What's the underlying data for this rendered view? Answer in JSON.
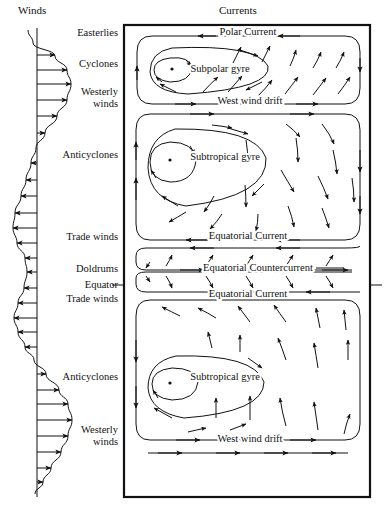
{
  "figure": {
    "width": 384,
    "height": 519,
    "background": "#ffffff",
    "ink_color": "#111111"
  },
  "headers": {
    "winds": "Winds",
    "currents": "Currents"
  },
  "wind_zones": [
    {
      "id": "easterlies",
      "label": "Easterlies",
      "y": 33
    },
    {
      "id": "cyclones",
      "label": "Cyclones",
      "y": 64
    },
    {
      "id": "westerly-winds-n",
      "label": "Westerly\nwinds",
      "y": 92
    },
    {
      "id": "anticyclones-n",
      "label": "Anticyclones",
      "y": 155
    },
    {
      "id": "trade-winds-n",
      "label": "Trade winds",
      "y": 237
    },
    {
      "id": "doldrums",
      "label": "Doldrums",
      "y": 269
    },
    {
      "id": "equator",
      "label": "Equator",
      "y": 285
    },
    {
      "id": "trade-winds-s",
      "label": "Trade winds",
      "y": 299
    },
    {
      "id": "anticyclones-s",
      "label": "Anticyclones",
      "y": 377
    },
    {
      "id": "westerly-winds-s",
      "label": "Westerly\nwinds",
      "y": 430
    }
  ],
  "current_labels": [
    {
      "id": "polar-current",
      "text": "Polar Current",
      "x": 248,
      "y": 35
    },
    {
      "id": "subpolar-gyre",
      "text": "Subpolar gyre",
      "x": 220,
      "y": 72
    },
    {
      "id": "west-wind-drift-north",
      "text": "West wind drift",
      "x": 250,
      "y": 104
    },
    {
      "id": "subtropical-gyre-north",
      "text": "Subtropical gyre",
      "x": 225,
      "y": 160
    },
    {
      "id": "equatorial-current-north",
      "text": "Equatorial Current",
      "x": 248,
      "y": 239
    },
    {
      "id": "equatorial-countercurrent",
      "text": "Equatorial Countercurrent",
      "x": 258,
      "y": 271
    },
    {
      "id": "equatorial-current-south",
      "text": "Equatorial Current",
      "x": 248,
      "y": 297
    },
    {
      "id": "subtropical-gyre-south",
      "text": "Subtropical gyre",
      "x": 225,
      "y": 380
    },
    {
      "id": "west-wind-drift-south",
      "text": "West wind drift",
      "x": 250,
      "y": 442
    }
  ],
  "ocean_box": {
    "left": 124,
    "top": 25,
    "right": 370,
    "bottom": 497
  },
  "chart_data": {
    "type": "line",
    "title": "Winds",
    "xlabel": "",
    "ylabel": "",
    "axis_x": 37,
    "profile_points": [
      {
        "y": 30,
        "u": -9
      },
      {
        "y": 43,
        "u": -4
      },
      {
        "y": 56,
        "u": 18
      },
      {
        "y": 70,
        "u": 30
      },
      {
        "y": 84,
        "u": 34
      },
      {
        "y": 100,
        "u": 30
      },
      {
        "y": 116,
        "u": 20
      },
      {
        "y": 133,
        "u": 8
      },
      {
        "y": 148,
        "u": -1
      },
      {
        "y": 163,
        "u": -6
      },
      {
        "y": 180,
        "u": -11
      },
      {
        "y": 196,
        "u": -16
      },
      {
        "y": 213,
        "u": -22
      },
      {
        "y": 228,
        "u": -24
      },
      {
        "y": 243,
        "u": -20
      },
      {
        "y": 258,
        "u": -12
      },
      {
        "y": 272,
        "u": -10
      },
      {
        "y": 288,
        "u": -13
      },
      {
        "y": 303,
        "u": -19
      },
      {
        "y": 318,
        "u": -23
      },
      {
        "y": 332,
        "u": -19
      },
      {
        "y": 347,
        "u": -12
      },
      {
        "y": 360,
        "u": -3
      },
      {
        "y": 374,
        "u": 9
      },
      {
        "y": 390,
        "u": 22
      },
      {
        "y": 404,
        "u": 31
      },
      {
        "y": 420,
        "u": 35
      },
      {
        "y": 436,
        "u": 31
      },
      {
        "y": 452,
        "u": 24
      },
      {
        "y": 468,
        "u": 14
      },
      {
        "y": 482,
        "u": 6
      },
      {
        "y": 494,
        "u": -2
      }
    ],
    "arrows": [
      {
        "y": 55,
        "u": 18
      },
      {
        "y": 70,
        "u": 30
      },
      {
        "y": 84,
        "u": 34
      },
      {
        "y": 100,
        "u": 30
      },
      {
        "y": 116,
        "u": 20
      },
      {
        "y": 133,
        "u": 8
      },
      {
        "y": 163,
        "u": -6
      },
      {
        "y": 180,
        "u": -11
      },
      {
        "y": 196,
        "u": -16
      },
      {
        "y": 213,
        "u": -22
      },
      {
        "y": 228,
        "u": -24
      },
      {
        "y": 243,
        "u": -20
      },
      {
        "y": 258,
        "u": -12
      },
      {
        "y": 272,
        "u": -10
      },
      {
        "y": 288,
        "u": -13
      },
      {
        "y": 303,
        "u": -19
      },
      {
        "y": 318,
        "u": -23
      },
      {
        "y": 332,
        "u": -19
      },
      {
        "y": 347,
        "u": -12
      },
      {
        "y": 374,
        "u": 9
      },
      {
        "y": 390,
        "u": 22
      },
      {
        "y": 404,
        "u": 31
      },
      {
        "y": 420,
        "u": 35
      },
      {
        "y": 436,
        "u": 31
      },
      {
        "y": 452,
        "u": 24
      },
      {
        "y": 468,
        "u": 14
      },
      {
        "y": 482,
        "u": 6
      }
    ]
  }
}
